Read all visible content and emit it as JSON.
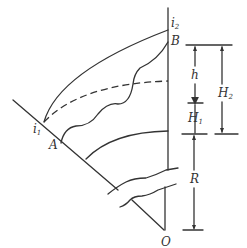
{
  "diagram": {
    "type": "geometric-section",
    "colors": {
      "line": "#333333",
      "background": "#ffffff"
    },
    "points": {
      "i1": {
        "label": "i",
        "sub": "1"
      },
      "i2": {
        "label": "i",
        "sub": "2"
      },
      "A": {
        "label": "A"
      },
      "B": {
        "label": "B"
      },
      "O": {
        "label": "O"
      }
    },
    "dimensions": {
      "h": {
        "label": "h"
      },
      "H1": {
        "label": "H",
        "sub": "1"
      },
      "H2": {
        "label": "H",
        "sub": "2"
      },
      "R": {
        "label": "R"
      }
    },
    "curves": [
      "outer-arc",
      "dashed-arc",
      "wavy-profile",
      "inner-arc",
      "left-radius",
      "right-radius"
    ]
  }
}
